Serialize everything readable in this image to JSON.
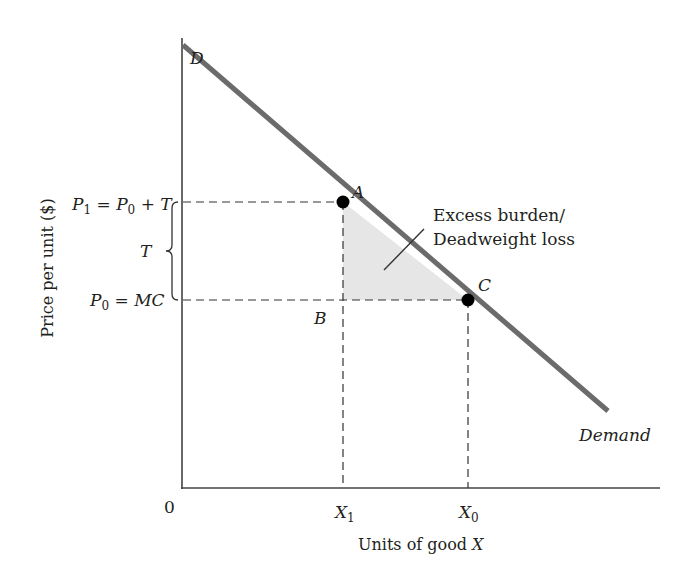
{
  "diagram": {
    "type": "supply-demand-tax-deadweight-loss",
    "colors": {
      "demand_line": "#6b6b6b",
      "axis": "#444444",
      "dashed": "#333333",
      "shaded_triangle": "#e6e6e6",
      "points": "#000000",
      "text": "#231f20"
    },
    "axes": {
      "y_label": "Price per unit ($)",
      "x_label_prefix": "Units of good ",
      "x_label_var": "X",
      "origin_label": "0"
    },
    "curve": {
      "start_label": "D",
      "end_label": "Demand"
    },
    "price_labels": {
      "p1": {
        "P": "P",
        "sub1": "1",
        "eq": " = ",
        "P0": "P",
        "sub0": "0",
        "plus": " + T"
      },
      "p0": {
        "P": "P",
        "sub0": "0",
        "eq": " = ",
        "rhs": "MC"
      },
      "tax": "T"
    },
    "quantity_labels": {
      "x1": {
        "X": "X",
        "sub": "1"
      },
      "x0": {
        "X": "X",
        "sub": "0"
      }
    },
    "points": [
      {
        "id": "A",
        "label": "A"
      },
      {
        "id": "B",
        "label": "B"
      },
      {
        "id": "C",
        "label": "C"
      }
    ],
    "annotation": {
      "line1": "Excess burden/",
      "line2": "Deadweight loss"
    }
  }
}
